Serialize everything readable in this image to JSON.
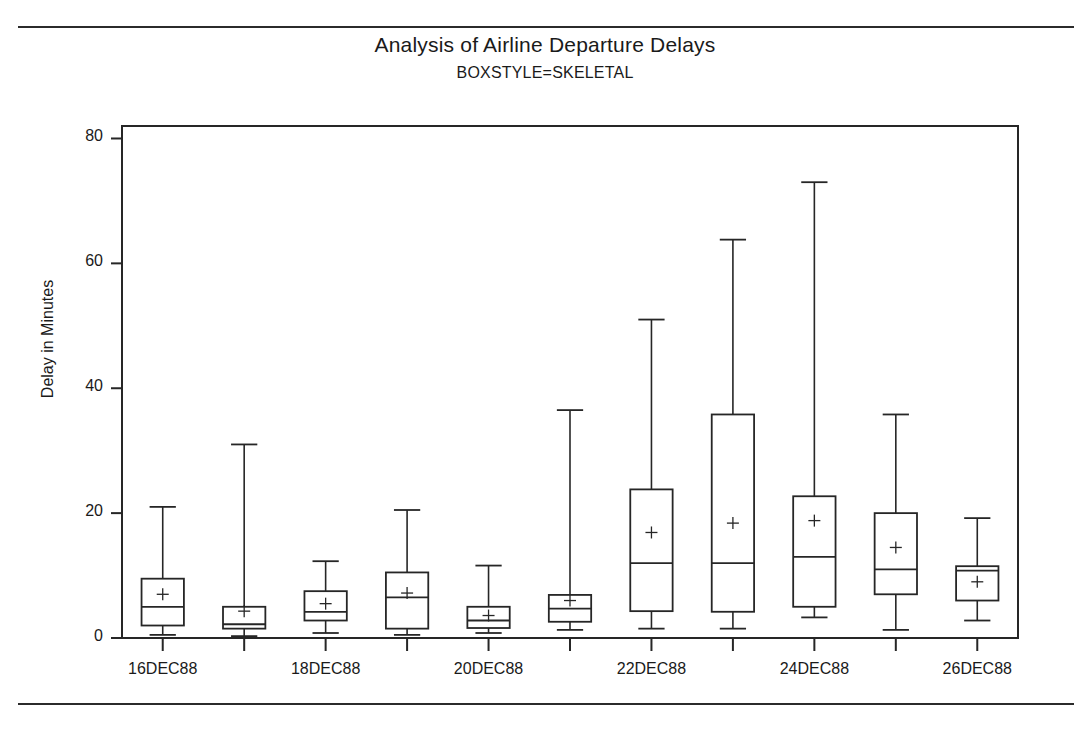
{
  "chart_data": {
    "type": "box",
    "title": "Analysis of Airline Departure Delays",
    "subtitle": "BOXSTYLE=SKELETAL",
    "xlabel": "",
    "ylabel": "Delay in Minutes",
    "ylim": [
      0,
      82
    ],
    "yticks": [
      0,
      20,
      40,
      60,
      80
    ],
    "ytick_labels": [
      "0",
      "20",
      "40",
      "60",
      "80"
    ],
    "grid": false,
    "legend": null,
    "categories": [
      "16DEC88",
      "17DEC88",
      "18DEC88",
      "19DEC88",
      "20DEC88",
      "21DEC88",
      "22DEC88",
      "23DEC88",
      "24DEC88",
      "25DEC88",
      "26DEC88"
    ],
    "xtick_labels_shown": [
      "16DEC88",
      "18DEC88",
      "20DEC88",
      "22DEC88",
      "24DEC88",
      "26DEC88"
    ],
    "boxes": [
      {
        "category": "16DEC88",
        "min": 0.5,
        "q1": 2.0,
        "median": 5.0,
        "q3": 9.5,
        "max": 21.0,
        "mean": 7.0
      },
      {
        "category": "17DEC88",
        "min": 0.3,
        "q1": 1.5,
        "median": 2.2,
        "q3": 5.0,
        "max": 31.0,
        "mean": 4.3
      },
      {
        "category": "18DEC88",
        "min": 0.8,
        "q1": 2.8,
        "median": 4.2,
        "q3": 7.5,
        "max": 12.3,
        "mean": 5.5
      },
      {
        "category": "19DEC88",
        "min": 0.5,
        "q1": 1.5,
        "median": 6.5,
        "q3": 10.5,
        "max": 20.5,
        "mean": 7.2
      },
      {
        "category": "20DEC88",
        "min": 0.8,
        "q1": 1.6,
        "median": 2.8,
        "q3": 5.0,
        "max": 11.6,
        "mean": 3.6
      },
      {
        "category": "21DEC88",
        "min": 1.3,
        "q1": 2.6,
        "median": 4.7,
        "q3": 6.9,
        "max": 36.5,
        "mean": 6.0
      },
      {
        "category": "22DEC88",
        "min": 1.5,
        "q1": 4.3,
        "median": 12.0,
        "q3": 23.8,
        "max": 51.0,
        "mean": 16.9
      },
      {
        "category": "23DEC88",
        "min": 1.5,
        "q1": 4.2,
        "median": 12.0,
        "q3": 35.8,
        "max": 63.8,
        "mean": 18.4
      },
      {
        "category": "24DEC88",
        "min": 3.3,
        "q1": 5.0,
        "median": 13.0,
        "q3": 22.7,
        "max": 73.0,
        "mean": 18.8
      },
      {
        "category": "25DEC88",
        "min": 1.3,
        "q1": 7.0,
        "median": 11.0,
        "q3": 20.0,
        "max": 35.8,
        "mean": 14.5
      },
      {
        "category": "26DEC88",
        "min": 2.8,
        "q1": 6.0,
        "median": 10.8,
        "q3": 11.5,
        "max": 19.2,
        "mean": 9.0
      }
    ],
    "colors": {
      "line": "#262626",
      "background": "#ffffff",
      "frame": "#262626"
    },
    "marks": {
      "mean_symbol": "plus",
      "box_style": "skeletal"
    }
  }
}
